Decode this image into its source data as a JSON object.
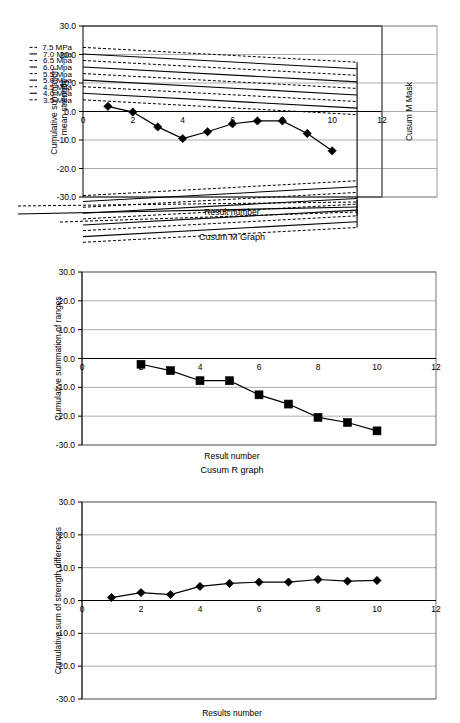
{
  "figure": {
    "width": 460,
    "height": 723,
    "background": "#ffffff",
    "ink": "#000000",
    "grid_color": "#888888"
  },
  "chart_data": [
    {
      "id": "cusum-m",
      "type": "line",
      "title": "Cusum M Graph",
      "xlabel": "Result number",
      "ylabel": "Cumulative summation – mean strength",
      "right_label": "Cusum M Mask",
      "xlim": [
        0,
        12
      ],
      "ylim": [
        -30,
        30
      ],
      "grid": true,
      "legend": "none",
      "xticks": [
        0,
        2,
        4,
        6,
        8,
        10,
        12
      ],
      "xticklabels": [
        "0",
        "2",
        "4",
        "6",
        "8",
        "10",
        "12"
      ],
      "yticks": [
        -30,
        -20,
        -10,
        0,
        10,
        20,
        30
      ],
      "yticklabels": [
        "-30.0",
        "-20.0",
        "-10.0",
        "0.0",
        "10.0",
        "20.0",
        "30.0"
      ],
      "x": [
        1,
        2,
        3,
        4,
        5,
        6,
        7,
        8,
        9,
        10
      ],
      "values": [
        1.8,
        -0.2,
        -5.4,
        -9.5,
        -7.1,
        -4.3,
        -3.3,
        -3.3,
        -7.7,
        -13.8
      ],
      "marker": "diamond",
      "mask_labels": [
        "7.5 MPa",
        "7.0 Mpa",
        "6.5 Mpa",
        "6.0 Mpa",
        "5.5 Mpa",
        "5.0 Mpa",
        "4.5 Mpa",
        "4.0 Mpa",
        "3.5 Mpa"
      ],
      "mask_label_values": [
        7.5,
        7.0,
        6.5,
        6.0,
        5.5,
        5.0,
        4.5,
        4.0,
        3.5
      ],
      "mask_label_styles": [
        "dashed",
        "solid",
        "dashed",
        "solid",
        "dashed",
        "solid",
        "dashed",
        "solid",
        "dashed"
      ],
      "mask_upper_intercepts": [
        22.5,
        20.2,
        17.9,
        15.6,
        13.3,
        11.0,
        8.7,
        6.4,
        4.1
      ],
      "mask_lower_intercepts": [
        -29.5,
        -31.6,
        -33.6,
        -35.7,
        -37.7,
        -39.8,
        -41.8,
        -43.9,
        -45.9
      ],
      "mask_vertex_x": 11.0
    },
    {
      "id": "cusum-r",
      "type": "line",
      "title": "Cusum R graph",
      "xlabel": "Result number",
      "ylabel": "Cumulative summation of ranges",
      "xlim": [
        0,
        12
      ],
      "ylim": [
        -30,
        30
      ],
      "grid": true,
      "legend": "none",
      "xticks": [
        0,
        2,
        4,
        6,
        8,
        10,
        12
      ],
      "xticklabels": [
        "0",
        "2",
        "4",
        "6",
        "8",
        "10",
        "12"
      ],
      "yticks": [
        -30,
        -20,
        -10,
        0,
        10,
        20,
        30
      ],
      "yticklabels": [
        "-30.0",
        "-20.0",
        "-10.0",
        "0.0",
        "10.0",
        "20.0",
        "30.0"
      ],
      "x": [
        2,
        3,
        4,
        5,
        6,
        7,
        8,
        9,
        10
      ],
      "values": [
        -2.0,
        -4.2,
        -7.7,
        -7.7,
        -12.6,
        -15.8,
        -20.4,
        -22.2,
        -25.1
      ],
      "marker": "square"
    },
    {
      "id": "cusum-strength-diff",
      "type": "line",
      "title": "",
      "xlabel": "Results number",
      "ylabel": "Cumulative sum of strength differences",
      "xlim": [
        0,
        12
      ],
      "ylim": [
        -30,
        30
      ],
      "grid": true,
      "legend": "none",
      "xticks": [
        0,
        2,
        4,
        6,
        8,
        10,
        12
      ],
      "xticklabels": [
        "0",
        "2",
        "4",
        "6",
        "8",
        "10",
        "12"
      ],
      "yticks": [
        -30,
        -20,
        -10,
        0,
        10,
        20,
        30
      ],
      "yticklabels": [
        "-30.0",
        "-20.0",
        "-10.0",
        "0.0",
        "10.0",
        "20.0",
        "30.0"
      ],
      "x": [
        1,
        2,
        3,
        4,
        5,
        6,
        7,
        8,
        9,
        10
      ],
      "values": [
        0.9,
        2.4,
        1.8,
        4.3,
        5.2,
        5.6,
        5.6,
        6.4,
        5.9,
        6.1
      ],
      "marker": "diamond"
    }
  ]
}
